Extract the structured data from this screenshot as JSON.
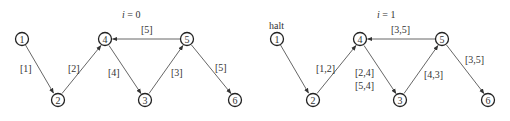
{
  "graphs": [
    {
      "title_var": "i",
      "title_eq": " = 0",
      "halt_label": null,
      "nodes": [
        {
          "id": "1",
          "x": 22,
          "y": 39
        },
        {
          "id": "2",
          "x": 58,
          "y": 100
        },
        {
          "id": "3",
          "x": 145,
          "y": 100
        },
        {
          "id": "4",
          "x": 105,
          "y": 39
        },
        {
          "id": "5",
          "x": 187,
          "y": 39
        },
        {
          "id": "6",
          "x": 235,
          "y": 100
        }
      ],
      "edges": [
        {
          "from": "1",
          "to": "2",
          "label": [
            "[1]"
          ]
        },
        {
          "from": "2",
          "to": "4",
          "label": [
            "[2]"
          ]
        },
        {
          "from": "4",
          "to": "3",
          "label": [
            "[4]"
          ]
        },
        {
          "from": "3",
          "to": "5",
          "label": [
            "[3]"
          ]
        },
        {
          "from": "5",
          "to": "4",
          "label": [
            "[5]"
          ]
        },
        {
          "from": "5",
          "to": "6",
          "label": [
            "[5]"
          ]
        }
      ]
    },
    {
      "title_var": "i",
      "title_eq": " = 1",
      "halt_label": "halt",
      "nodes": [
        {
          "id": "1",
          "x": 277,
          "y": 39
        },
        {
          "id": "2",
          "x": 313,
          "y": 100
        },
        {
          "id": "3",
          "x": 400,
          "y": 100
        },
        {
          "id": "4",
          "x": 360,
          "y": 39
        },
        {
          "id": "5",
          "x": 442,
          "y": 39
        },
        {
          "id": "6",
          "x": 488,
          "y": 100
        }
      ],
      "edges": [
        {
          "from": "1",
          "to": "2",
          "label": []
        },
        {
          "from": "2",
          "to": "4",
          "label": [
            "[1,2]"
          ]
        },
        {
          "from": "4",
          "to": "3",
          "label": [
            "[2,4]",
            "[5,4]"
          ]
        },
        {
          "from": "3",
          "to": "5",
          "label": [
            "[4,3]"
          ]
        },
        {
          "from": "5",
          "to": "4",
          "label": [
            "[3,5]"
          ]
        },
        {
          "from": "5",
          "to": "6",
          "label": [
            "[3,5]"
          ]
        }
      ]
    }
  ]
}
